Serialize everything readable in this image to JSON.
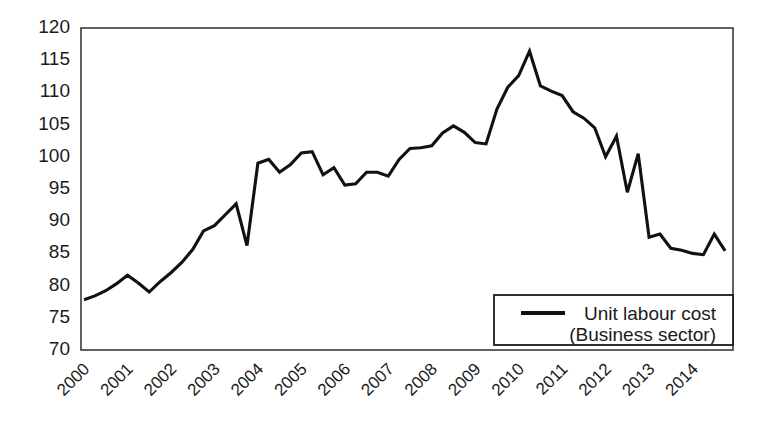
{
  "chart_data": {
    "type": "line",
    "title": "",
    "xlabel": "",
    "ylabel": "",
    "ylim": [
      70,
      120
    ],
    "ytick_step": 5,
    "yticks": [
      120,
      115,
      110,
      105,
      100,
      95,
      90,
      85,
      80,
      75,
      70
    ],
    "grid": false,
    "legend_position": "bottom-right",
    "categories": [
      "2000",
      "2001",
      "2002",
      "2003",
      "2004",
      "2005",
      "2006",
      "2007",
      "2008",
      "2009",
      "2010",
      "2011",
      "2012",
      "2013",
      "2014"
    ],
    "x_tick_labels": [
      "2000",
      "2001",
      "2002",
      "2003",
      "2004",
      "2005",
      "2006",
      "2007",
      "2008",
      "2009",
      "2010",
      "2011",
      "2012",
      "2013",
      "2014"
    ],
    "x_period": "quarterly",
    "series": [
      {
        "name": "Unit labour cost (Business sector)",
        "color": "#111111",
        "x": [
          "2000Q1",
          "2000Q2",
          "2000Q3",
          "2000Q4",
          "2001Q1",
          "2001Q2",
          "2001Q3",
          "2001Q4",
          "2002Q1",
          "2002Q2",
          "2002Q3",
          "2002Q4",
          "2003Q1",
          "2003Q2",
          "2003Q3",
          "2003Q4",
          "2004Q1",
          "2004Q2",
          "2004Q3",
          "2004Q4",
          "2005Q1",
          "2005Q2",
          "2005Q3",
          "2005Q4",
          "2006Q1",
          "2006Q2",
          "2006Q3",
          "2006Q4",
          "2007Q1",
          "2007Q2",
          "2007Q3",
          "2007Q4",
          "2008Q1",
          "2008Q2",
          "2008Q3",
          "2008Q4",
          "2009Q1",
          "2009Q2",
          "2009Q3",
          "2009Q4",
          "2010Q1",
          "2010Q2",
          "2010Q3",
          "2010Q4",
          "2011Q1",
          "2011Q2",
          "2011Q3",
          "2011Q4",
          "2012Q1",
          "2012Q2",
          "2012Q3",
          "2012Q4",
          "2013Q1",
          "2013Q2",
          "2013Q3",
          "2013Q4",
          "2014Q1",
          "2014Q2",
          "2014Q3",
          "2014Q4"
        ],
        "values": [
          77.8,
          78.4,
          79.2,
          80.3,
          81.6,
          80.4,
          79.0,
          80.6,
          82.0,
          83.6,
          85.6,
          88.5,
          89.3,
          91.0,
          92.7,
          86.2,
          99.0,
          99.6,
          97.6,
          98.8,
          100.6,
          100.8,
          97.2,
          98.3,
          95.6,
          95.8,
          97.6,
          97.6,
          97.0,
          99.6,
          101.3,
          101.4,
          101.7,
          103.7,
          104.8,
          103.8,
          102.2,
          102.0,
          107.4,
          110.8,
          112.6,
          116.4,
          111.0,
          110.2,
          109.5,
          107.0,
          106.0,
          104.5,
          100.0,
          103.2,
          94.5,
          100.5,
          87.5,
          88.0,
          85.8,
          85.5,
          85.0,
          84.8,
          88.0,
          85.4
        ]
      }
    ],
    "legend": [
      {
        "label_line1": "Unit labour cost",
        "label_line2": "(Business sector)",
        "color": "#111111"
      }
    ]
  }
}
